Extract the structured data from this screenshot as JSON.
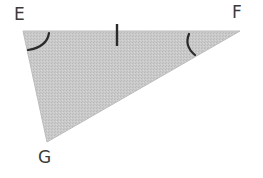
{
  "diagram": {
    "type": "triangle",
    "fill_color": "#c9c9c9",
    "stroke_color": "#2a2a2a",
    "vertices": [
      {
        "name": "E",
        "x": 23,
        "y": 31
      },
      {
        "name": "F",
        "x": 240,
        "y": 31
      },
      {
        "name": "G",
        "x": 47,
        "y": 142
      }
    ],
    "labels": {
      "E": "E",
      "F": "F",
      "G": "G"
    },
    "markings": {
      "side_tick": {
        "side": "EF",
        "count": 1
      },
      "angle_arcs": [
        {
          "vertex": "E",
          "count": 1
        },
        {
          "vertex": "F",
          "count": 1
        }
      ]
    }
  }
}
